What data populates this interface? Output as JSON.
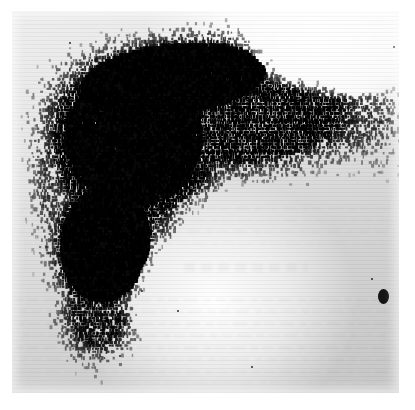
{
  "document": {
    "kind": "scanned-medical-image",
    "modality_label": "rectilinear-photoscan",
    "caption": "",
    "page_background_color": "#fdfdfd"
  },
  "plate": {
    "left": 12,
    "top": 11,
    "width": 387,
    "height": 382,
    "paper_light_color": "#ffffff",
    "paper_mid_color": "#e6e6e6",
    "paper_dark_color": "#c6c6c6",
    "uptake_color": "#0b0b0b"
  },
  "markers": [
    {
      "name": "reference-marker-dot",
      "x": 371,
      "y": 285,
      "rx": 5.5,
      "ry": 7.5
    }
  ],
  "specks": [
    {
      "x": 196,
      "y": 23,
      "r": 1.3
    },
    {
      "x": 58,
      "y": 32,
      "r": 1.0
    },
    {
      "x": 382,
      "y": 36,
      "r": 1.1
    },
    {
      "x": 130,
      "y": 280,
      "r": 1.2
    },
    {
      "x": 166,
      "y": 300,
      "r": 1.0
    },
    {
      "x": 240,
      "y": 356,
      "r": 1.1
    },
    {
      "x": 108,
      "y": 345,
      "r": 0.9
    },
    {
      "x": 360,
      "y": 268,
      "r": 0.9
    }
  ],
  "ghost_text_lines": [
    {
      "top": 196,
      "left": 8,
      "width": 372,
      "opacity": 0.3
    },
    {
      "top": 208,
      "left": 10,
      "width": 366,
      "opacity": 0.26
    },
    {
      "top": 219,
      "left": 6,
      "width": 374,
      "opacity": 0.34
    },
    {
      "top": 231,
      "left": 12,
      "width": 360,
      "opacity": 0.22
    },
    {
      "top": 287,
      "left": 4,
      "width": 378,
      "opacity": 0.42
    },
    {
      "top": 299,
      "left": 8,
      "width": 372,
      "opacity": 0.4
    },
    {
      "top": 311,
      "left": 6,
      "width": 376,
      "opacity": 0.44
    },
    {
      "top": 323,
      "left": 10,
      "width": 366,
      "opacity": 0.4
    },
    {
      "top": 335,
      "left": 4,
      "width": 380,
      "opacity": 0.46
    },
    {
      "top": 347,
      "left": 8,
      "width": 370,
      "opacity": 0.38
    },
    {
      "top": 359,
      "left": 6,
      "width": 374,
      "opacity": 0.34
    },
    {
      "top": 371,
      "left": 12,
      "width": 358,
      "opacity": 0.26
    }
  ],
  "ghost_heading": {
    "top": 252,
    "left": 172,
    "width": 124,
    "opacity": 0.3
  },
  "scan_field": {
    "description": "Dot-density photoscan of hepatic isotope uptake. Dense confluent uptake fills the upper-left and central field with a descending inferior lobe toward the lower left; a sparse scattered band trails to the right margin.",
    "dot_seed": 20240917,
    "raster_line_pitch_px": 3.1,
    "dot_width_px": 2.2,
    "dot_height_px": 3.0,
    "regions": [
      {
        "name": "right-hepatic-lobe-core",
        "cx": 120,
        "cy": 128,
        "rx": 88,
        "ry": 86,
        "density": 1.0,
        "rot": -12
      },
      {
        "name": "superior-dome",
        "cx": 160,
        "cy": 68,
        "rx": 118,
        "ry": 44,
        "density": 0.92,
        "rot": -6
      },
      {
        "name": "mid-transverse-band",
        "cx": 225,
        "cy": 108,
        "rx": 128,
        "ry": 58,
        "density": 0.8,
        "rot": -4
      },
      {
        "name": "right-extension-band",
        "cx": 300,
        "cy": 110,
        "rx": 96,
        "ry": 46,
        "density": 0.52,
        "rot": -2
      },
      {
        "name": "far-right-sparse-tail",
        "cx": 362,
        "cy": 118,
        "rx": 52,
        "ry": 46,
        "density": 0.3,
        "rot": 0
      },
      {
        "name": "left-lobe-descending",
        "cx": 92,
        "cy": 232,
        "rx": 56,
        "ry": 74,
        "density": 0.9,
        "rot": 8
      },
      {
        "name": "inferior-tip",
        "cx": 86,
        "cy": 300,
        "rx": 42,
        "ry": 54,
        "density": 0.72,
        "rot": 6
      },
      {
        "name": "hilar-bridge",
        "cx": 160,
        "cy": 196,
        "rx": 70,
        "ry": 40,
        "density": 0.62,
        "rot": -18
      },
      {
        "name": "lateral-left-margin",
        "cx": 52,
        "cy": 170,
        "rx": 36,
        "ry": 74,
        "density": 0.55,
        "rot": 0
      }
    ],
    "cold_areas": [
      {
        "name": "gallbladder-fossa-cold-spot",
        "cx": 232,
        "cy": 214,
        "rx": 62,
        "ry": 36,
        "strength": 0.85
      },
      {
        "name": "inferior-right-cold-field",
        "cx": 250,
        "cy": 280,
        "rx": 120,
        "ry": 70,
        "strength": 0.95
      },
      {
        "name": "upper-right-cold-field",
        "cx": 330,
        "cy": 34,
        "rx": 90,
        "ry": 44,
        "strength": 0.9
      }
    ]
  },
  "margins": {
    "top": 11,
    "left": 12,
    "right": 16,
    "bottom": 17,
    "color": "#ffffff"
  }
}
